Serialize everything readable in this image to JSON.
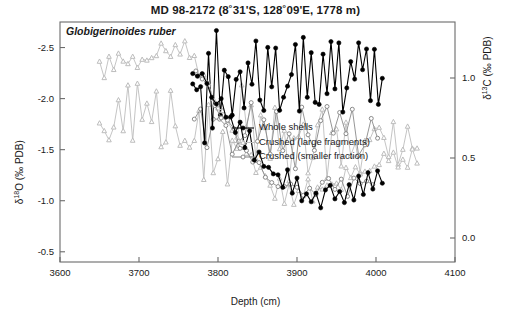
{
  "figure": {
    "title_text": "MD 98-2172 (8˚31'S, 128˚09'E, 1778 m)",
    "taxon": "Globigerinoides ruber"
  },
  "legend": {
    "items": [
      {
        "label": "Whole shells",
        "marker": "filled-circle",
        "color": "#000000"
      },
      {
        "label": "Crushed (large fragments)",
        "marker": "open-triangle",
        "color": "#bdbdbd"
      },
      {
        "label": "Crushed (smaller fraction)",
        "marker": "open-circle",
        "color": "#8a8a8a"
      }
    ]
  },
  "axes": {
    "x": {
      "label": "Depth (cm)",
      "ticks": [
        "3600",
        "3700",
        "3800",
        "3900",
        "4000",
        "4100"
      ],
      "min": 3600,
      "max": 4100
    },
    "y_left": {
      "label": "δ¹⁸O (‰ PDB)",
      "ticks": [
        "-2.5",
        "-2.0",
        "-1.5",
        "-1.0",
        "-0.5"
      ],
      "min": -2.75,
      "max": -0.4,
      "inverted": true
    },
    "y_right": {
      "label": "δ¹³C (‰ PDB)",
      "ticks": [
        "1.0",
        "0.5",
        "0.0"
      ],
      "min": -0.15,
      "max": 1.35
    }
  },
  "chart_data": {
    "type": "line",
    "title": "MD 98-2172 (8˚31'S, 128˚09'E, 1778 m)",
    "subtitle": "Globigerinoides ruber",
    "xlabel": "Depth (cm)",
    "ylabel": "δ¹⁸O (‰ PDB)",
    "ylabel_right": "δ¹³C (‰ PDB)",
    "xlim": [
      3600,
      4100
    ],
    "ylim_left": [
      -0.4,
      -2.75
    ],
    "ylim_right": [
      -0.15,
      1.35
    ],
    "grid": false,
    "legend_position": "center",
    "panels": [
      {
        "name": "d13C",
        "axis": "right",
        "series": [
          {
            "name": "Whole shells",
            "marker": "filled-circle",
            "color": "#000000",
            "x": [
              3768,
              3773,
              3778,
              3783,
              3788,
              3793,
              3798,
              3803,
              3808,
              3813,
              3818,
              3823,
              3828,
              3833,
              3838,
              3843,
              3848,
              3853,
              3858,
              3863,
              3868,
              3873,
              3878,
              3883,
              3888,
              3893,
              3898,
              3903,
              3908,
              3913,
              3918,
              3923,
              3928,
              3933,
              3938,
              3943,
              3948,
              3953,
              3958,
              3963,
              3968,
              3973,
              3978,
              3983,
              3988,
              3993,
              3998,
              4003,
              4008
            ],
            "y": [
              0.92,
              0.78,
              1.05,
              0.7,
              1.22,
              0.74,
              1.18,
              0.86,
              0.95,
              1.1,
              0.82,
              0.9,
              1.02,
              0.88,
              1.14,
              0.96,
              1.2,
              1.0,
              0.84,
              1.08,
              0.92,
              1.16,
              0.74,
              0.98,
              1.1,
              0.86,
              1.04,
              0.8,
              1.12,
              0.94,
              1.22,
              1.0,
              0.88,
              1.18,
              0.96,
              1.06,
              0.78,
              1.14,
              0.9,
              1.02,
              1.2,
              0.84,
              1.08,
              0.96,
              1.16,
              0.88,
              1.1,
              0.98,
              1.04
            ]
          },
          {
            "name": "Crushed (large fragments)",
            "marker": "open-triangle",
            "color": "#bdbdbd",
            "x": [
              3650,
              3656,
              3662,
              3668,
              3674,
              3680,
              3686,
              3692,
              3698,
              3704,
              3710,
              3716,
              3722,
              3728,
              3734,
              3740,
              3746,
              3752,
              3758,
              3764,
              3770,
              3776,
              3782,
              3788,
              3794,
              3800,
              3806,
              3812,
              3818,
              3824,
              3830,
              3836,
              3842,
              3848,
              3854,
              3860,
              3866,
              3872,
              3878,
              3884,
              3890,
              3896,
              3902,
              3908,
              3914,
              3920,
              3926,
              3932,
              3938,
              3944,
              3950,
              3956,
              3962,
              3968,
              3974,
              3980,
              3986,
              3992,
              3998,
              4004,
              4010,
              4016,
              4022,
              4028,
              4034,
              4040,
              4046,
              4052
            ],
            "y": [
              0.66,
              0.52,
              0.74,
              0.58,
              0.8,
              0.64,
              0.86,
              0.7,
              0.92,
              0.62,
              0.84,
              0.68,
              0.9,
              0.72,
              0.6,
              0.78,
              0.54,
              0.7,
              0.46,
              0.64,
              0.58,
              0.76,
              0.5,
              0.68,
              0.42,
              0.6,
              0.72,
              0.48,
              0.66,
              0.54,
              0.8,
              0.58,
              0.7,
              0.44,
              0.62,
              0.76,
              0.52,
              0.68,
              0.58,
              0.74,
              0.46,
              0.64,
              0.56,
              0.72,
              0.5,
              0.66,
              0.6,
              0.78,
              0.54,
              0.7,
              0.62,
              0.48,
              0.74,
              0.58,
              0.66,
              0.52,
              0.7,
              0.6,
              0.76,
              0.54,
              0.68,
              0.62,
              0.72,
              0.58,
              0.66,
              0.7,
              0.6,
              0.64
            ]
          },
          {
            "name": "Crushed (smaller fraction)",
            "marker": "open-circle",
            "color": "#8a8a8a",
            "x": [
              3770,
              3778,
              3786,
              3794,
              3802,
              3810,
              3818,
              3826,
              3834,
              3842,
              3850,
              3858,
              3866,
              3874,
              3882,
              3890,
              3898,
              3906,
              3914,
              3922,
              3930,
              3938,
              3946,
              3954,
              3962,
              3970,
              3978,
              3986,
              3994,
              4002
            ],
            "y": [
              0.64,
              0.78,
              0.56,
              0.72,
              0.62,
              0.84,
              0.58,
              0.74,
              0.66,
              0.8,
              0.54,
              0.7,
              0.62,
              0.76,
              0.6,
              0.72,
              0.56,
              0.68,
              0.74,
              0.58,
              0.66,
              0.78,
              0.6,
              0.7,
              0.64,
              0.76,
              0.58,
              0.68,
              0.72,
              0.62
            ]
          }
        ]
      },
      {
        "name": "d18O",
        "axis": "left",
        "series": [
          {
            "name": "Whole shells",
            "marker": "filled-circle",
            "color": "#000000",
            "x": [
              3768,
              3774,
              3780,
              3786,
              3792,
              3798,
              3804,
              3810,
              3816,
              3822,
              3828,
              3834,
              3840,
              3846,
              3852,
              3858,
              3864,
              3870,
              3876,
              3882,
              3888,
              3894,
              3900,
              3906,
              3912,
              3918,
              3924,
              3930,
              3936,
              3942,
              3948,
              3954,
              3960,
              3966,
              3972,
              3978,
              3984,
              3990,
              3996,
              4002,
              4008
            ],
            "y": [
              -2.3,
              -2.22,
              -2.26,
              -2.1,
              -2.02,
              -1.88,
              -1.94,
              -1.76,
              -1.82,
              -1.64,
              -1.7,
              -1.56,
              -1.62,
              -1.44,
              -1.5,
              -1.34,
              -1.4,
              -1.22,
              -1.3,
              -1.16,
              -1.24,
              -1.08,
              -1.18,
              -1.02,
              -1.12,
              -0.96,
              -1.08,
              -0.92,
              -1.04,
              -1.14,
              -0.98,
              -1.1,
              -1.0,
              -1.18,
              -1.06,
              -1.22,
              -1.12,
              -1.28,
              -1.16,
              -1.34,
              -1.24
            ]
          },
          {
            "name": "Crushed (large fragments)",
            "marker": "open-triangle",
            "color": "#bdbdbd",
            "x": [
              3650,
              3656,
              3662,
              3668,
              3674,
              3680,
              3686,
              3692,
              3698,
              3704,
              3710,
              3716,
              3722,
              3728,
              3734,
              3740,
              3746,
              3752,
              3758,
              3764,
              3770,
              3776,
              3782,
              3788,
              3794,
              3800,
              3806,
              3812,
              3818,
              3824,
              3830,
              3836,
              3842,
              3848,
              3854,
              3860,
              3866,
              3872,
              3878,
              3884,
              3890,
              3896,
              3902,
              3908,
              3914,
              3920,
              3926,
              3932,
              3938,
              3944,
              3950,
              3956,
              3962,
              3968,
              3974,
              3980,
              3986,
              3992,
              3998,
              4004,
              4010,
              4016,
              4022,
              4028,
              4034,
              4040,
              4046,
              4052
            ],
            "y": [
              -2.32,
              -2.26,
              -2.34,
              -2.28,
              -2.38,
              -2.3,
              -2.36,
              -2.42,
              -2.34,
              -2.4,
              -2.32,
              -2.44,
              -2.36,
              -2.48,
              -2.4,
              -2.46,
              -2.52,
              -2.44,
              -2.5,
              -2.42,
              -2.36,
              -2.28,
              -2.2,
              -2.12,
              -2.04,
              -1.96,
              -1.86,
              -1.78,
              -1.7,
              -1.62,
              -1.54,
              -1.46,
              -1.4,
              -1.32,
              -1.26,
              -1.2,
              -1.14,
              -1.08,
              -1.16,
              -1.04,
              -1.12,
              -1.0,
              -1.1,
              -1.02,
              -1.14,
              -1.06,
              -1.18,
              -1.08,
              -1.2,
              -1.1,
              -1.22,
              -1.14,
              -1.26,
              -1.16,
              -1.3,
              -1.2,
              -1.34,
              -1.24,
              -1.38,
              -1.28,
              -1.42,
              -1.32,
              -1.46,
              -1.36,
              -1.44,
              -1.38,
              -1.48,
              -1.4
            ]
          },
          {
            "name": "Crushed (smaller fraction)",
            "marker": "open-circle",
            "color": "#8a8a8a",
            "x": [
              3772,
              3780,
              3788,
              3796,
              3804,
              3812,
              3820,
              3828,
              3836,
              3844,
              3852,
              3860,
              3868,
              3876,
              3884,
              3892,
              3900,
              3908,
              3916,
              3924,
              3932,
              3940,
              3948,
              3956,
              3964,
              3972,
              3980,
              3988,
              3996
            ],
            "y": [
              -2.24,
              -2.16,
              -2.06,
              -1.96,
              -1.86,
              -1.76,
              -1.66,
              -1.58,
              -1.48,
              -1.4,
              -1.32,
              -1.24,
              -1.18,
              -1.12,
              -1.2,
              -1.1,
              -1.16,
              -1.06,
              -1.14,
              -1.04,
              -1.12,
              -1.18,
              -1.08,
              -1.16,
              -1.1,
              -1.22,
              -1.14,
              -1.26,
              -1.18
            ]
          }
        ]
      }
    ]
  }
}
